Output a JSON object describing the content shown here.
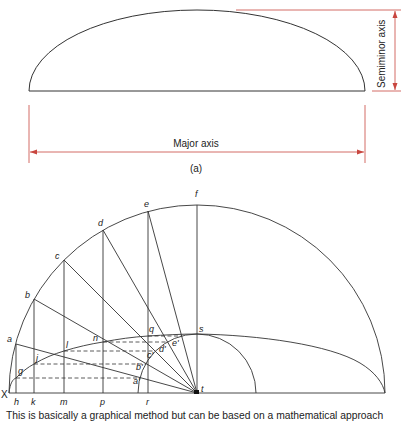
{
  "figure_a": {
    "major_axis_label": "Major axis",
    "semiminor_axis_label": "Semiminor axis",
    "panel_label": "(a)",
    "dimension_color": "#c8463f"
  },
  "figure_b": {
    "outer_circle_points": [
      "a",
      "b",
      "c",
      "d",
      "e",
      "f"
    ],
    "inner_circle_points": [
      "a'",
      "b'",
      "c'",
      "d'",
      "e'",
      "s"
    ],
    "baseline_points": [
      "X",
      "h",
      "k",
      "m",
      "p",
      "r",
      "t"
    ],
    "ellipse_points": [
      "g",
      "j",
      "l",
      "n",
      "q",
      "s"
    ],
    "labels": {
      "X": "X",
      "a": "a",
      "b": "b",
      "c": "c",
      "d": "d",
      "e": "e",
      "f": "f",
      "g": "g",
      "h": "h",
      "j": "j",
      "k": "k",
      "l": "l",
      "m": "m",
      "n": "n",
      "p": "p",
      "q": "q",
      "r": "r",
      "s": "s",
      "t": "t",
      "a_p": "a'",
      "b_p": "b'",
      "c_p": "c'",
      "d_p": "d'",
      "e_p": "e'"
    }
  },
  "caption": "This is basically a graphical method but can be based on a mathematical approach"
}
